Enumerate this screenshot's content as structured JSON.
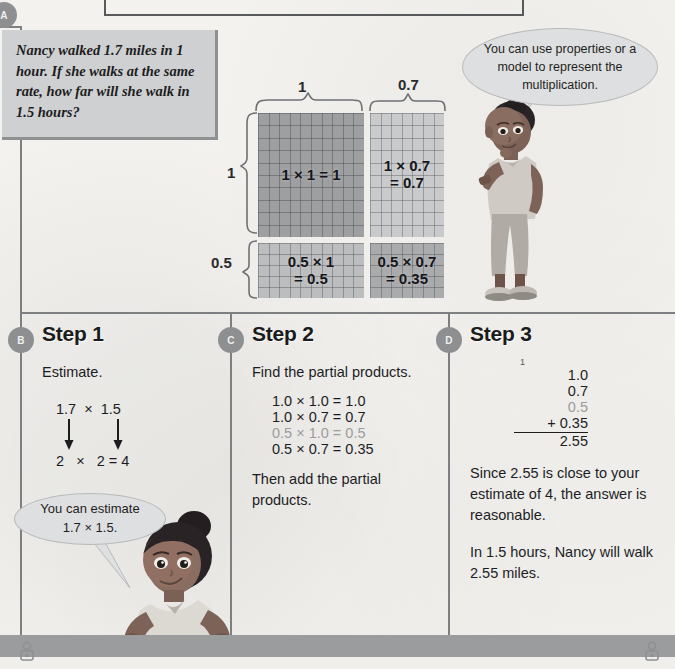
{
  "page": {
    "sections": [
      {
        "id": "A",
        "label": "A"
      },
      {
        "id": "B",
        "label": "B"
      },
      {
        "id": "C",
        "label": "C"
      },
      {
        "id": "D",
        "label": "D"
      }
    ],
    "footer_icon_name": "person-icon"
  },
  "problem": {
    "text": "Nancy walked 1.7 miles in 1 hour. If she walks at the same rate, how far will she walk in 1.5 hours?"
  },
  "bubbles": {
    "top": {
      "text": "You can use properties or a model to represent the multiplication.",
      "speaker": "boy-character"
    },
    "bottom": {
      "line1": "You can estimate",
      "line2": "1.7 × 1.5.",
      "speaker": "girl-character"
    }
  },
  "model": {
    "top_labels": [
      "1",
      "0.7"
    ],
    "left_labels": [
      "1",
      "0.5"
    ],
    "cells": [
      {
        "id": "top-left",
        "line1": "1 × 1 = 1",
        "line2": ""
      },
      {
        "id": "top-right",
        "line1": "1 × 0.7",
        "line2": "= 0.7"
      },
      {
        "id": "bottom-left",
        "line1": "0.5 × 1",
        "line2": "= 0.5"
      },
      {
        "id": "bottom-right",
        "line1": "0.5 × 0.7",
        "line2": "= 0.35"
      }
    ]
  },
  "step1": {
    "title": "Step 1",
    "instruction": "Estimate.",
    "top_row": "1.7  ×  1.5",
    "bottom_row": "2   ×   2 = 4"
  },
  "step2": {
    "title": "Step 2",
    "instruction": "Find the partial products.",
    "products": [
      {
        "text": "1.0 × 1.0 = 1.0",
        "faded": false
      },
      {
        "text": "1.0 × 0.7 = 0.7",
        "faded": false
      },
      {
        "text": "0.5 × 1.0 = 0.5",
        "faded": true
      },
      {
        "text": "0.5 × 0.7 = 0.35",
        "faded": false
      }
    ],
    "closing": "Then add the partial products."
  },
  "step3": {
    "title": "Step 3",
    "carry": "1",
    "addends": [
      {
        "value": "1.0",
        "faded": false
      },
      {
        "value": "0.7",
        "faded": false
      },
      {
        "value": "0.5",
        "faded": true
      },
      {
        "value": "+ 0.35",
        "faded": false
      }
    ],
    "sum": "2.55",
    "para1": "Since 2.55 is close to your estimate of 4, the answer is reasonable.",
    "para2": "In 1.5 hours, Nancy will walk 2.55 miles."
  },
  "colors": {
    "paper": "#f3f2ef",
    "rule": "#7d7f81",
    "badge": "#8d8f91",
    "problem_box": "#cfd0d1",
    "bubble": "#dedfe0",
    "grid_dark": "#9d9fa1",
    "grid_light": "#c9cacb",
    "grid_mid": "#bcbdbe",
    "grid_mid_dark": "#a9abad",
    "faded_text": "#9b9c9e"
  }
}
